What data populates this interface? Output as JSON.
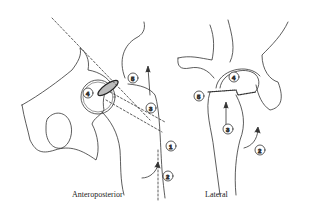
{
  "figure": {
    "views": [
      {
        "id": "anteroposterior",
        "caption": "Anteroposterior",
        "markers": [
          "1",
          "2",
          "3",
          "4",
          "5"
        ]
      },
      {
        "id": "lateral",
        "caption": "Lateral",
        "markers": [
          "2",
          "3",
          "4",
          "5"
        ]
      }
    ],
    "line_color": "#333333",
    "background": "#ffffff"
  }
}
